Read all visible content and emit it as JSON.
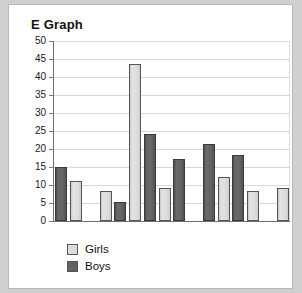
{
  "card": {
    "title": "E Graph"
  },
  "legend": {
    "position": "bottom-left",
    "items": [
      {
        "label": "Girls",
        "color": "#dcdcdc"
      },
      {
        "label": "Boys",
        "color": "#636363"
      }
    ]
  },
  "axis": {
    "y_ticks": [
      "50",
      "45",
      "40",
      "35",
      "30",
      "25",
      "20",
      "15",
      "10",
      "5",
      "0"
    ]
  },
  "chart_data": {
    "type": "bar",
    "title": "E Graph",
    "xlabel": "",
    "ylabel": "",
    "ylim": [
      0,
      50
    ],
    "ytick_step": 5,
    "yticks": [
      0,
      5,
      10,
      15,
      20,
      25,
      30,
      35,
      40,
      45,
      50
    ],
    "grid": true,
    "legend_position": "bottom-left",
    "colors": {
      "Girls": "#dcdcdc",
      "Boys": "#636363"
    },
    "series_names": [
      "Girls",
      "Boys"
    ],
    "note": "Bars are drawn in a single row alternating between series with blank gaps; no x-axis category labels are shown.",
    "bars": [
      {
        "index": 1,
        "series": "Boys",
        "value": 15.0
      },
      {
        "index": 2,
        "series": "Girls",
        "value": 11.2
      },
      {
        "index": 3,
        "series": "gap",
        "value": 0
      },
      {
        "index": 4,
        "series": "Girls",
        "value": 8.2
      },
      {
        "index": 5,
        "series": "Boys",
        "value": 5.2
      },
      {
        "index": 6,
        "series": "Girls",
        "value": 43.5
      },
      {
        "index": 7,
        "series": "Boys",
        "value": 24.2
      },
      {
        "index": 8,
        "series": "Girls",
        "value": 9.2
      },
      {
        "index": 9,
        "series": "Boys",
        "value": 17.2
      },
      {
        "index": 10,
        "series": "gap",
        "value": 0
      },
      {
        "index": 11,
        "series": "Boys",
        "value": 21.3
      },
      {
        "index": 12,
        "series": "Girls",
        "value": 12.2
      },
      {
        "index": 13,
        "series": "Boys",
        "value": 18.3
      },
      {
        "index": 14,
        "series": "Girls",
        "value": 8.4
      },
      {
        "index": 15,
        "series": "gap",
        "value": 0
      },
      {
        "index": 16,
        "series": "Girls",
        "value": 9.3
      }
    ]
  }
}
